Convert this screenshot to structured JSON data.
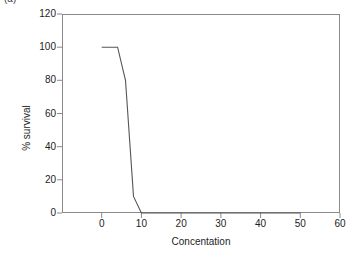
{
  "figure": {
    "caption_remnant": "(a)",
    "background_color": "#ffffff",
    "frame_color": "#8a8a8a",
    "line_color": "#555555"
  },
  "chart_data": {
    "type": "line",
    "title": "",
    "xlabel": "Concentation",
    "ylabel": "% survival",
    "xlim": [
      -10,
      60
    ],
    "ylim": [
      0,
      120
    ],
    "xticks": [
      0,
      10,
      20,
      30,
      40,
      50,
      60
    ],
    "yticks": [
      0,
      20,
      40,
      60,
      80,
      100,
      120
    ],
    "xtick_labels": [
      "0",
      "10",
      "20",
      "30",
      "40",
      "50",
      "60"
    ],
    "ytick_labels": [
      "0",
      "20",
      "40",
      "60",
      "80",
      "100",
      "120"
    ],
    "grid": false,
    "legend": null,
    "series": [
      {
        "name": "% survival",
        "x": [
          0,
          4,
          6,
          8,
          10,
          50
        ],
        "values": [
          100,
          100,
          80,
          10,
          0,
          0
        ]
      }
    ]
  }
}
